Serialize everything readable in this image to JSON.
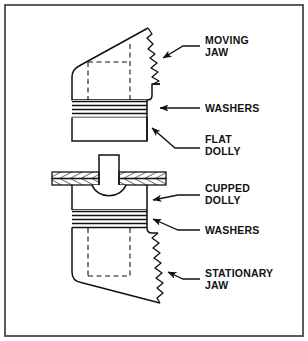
{
  "figure": {
    "background_color": "#ffffff",
    "border_color": "#4a4a4a",
    "line_color": "#111111"
  },
  "labels": {
    "moving_jaw_line1": "MOVING",
    "moving_jaw_line2": "JAW",
    "washers_top": "WASHERS",
    "flat_dolly_line1": "FLAT",
    "flat_dolly_line2": "DOLLY",
    "cupped_dolly_line1": "CUPPED",
    "cupped_dolly_line2": "DOLLY",
    "washers_bottom": "WASHERS",
    "stationary_jaw_line1": "STATIONARY",
    "stationary_jaw_line2": "JAW"
  },
  "parts": [
    {
      "id": "moving-jaw",
      "label": "MOVING JAW",
      "callout_x": 206,
      "callout_y": 44
    },
    {
      "id": "washers-top",
      "label": "WASHERS",
      "callout_x": 206,
      "callout_y": 106
    },
    {
      "id": "flat-dolly",
      "label": "FLAT DOLLY",
      "callout_x": 206,
      "callout_y": 140
    },
    {
      "id": "cupped-dolly",
      "label": "CUPPED DOLLY",
      "callout_x": 206,
      "callout_y": 193
    },
    {
      "id": "washers-bottom",
      "label": "WASHERS",
      "callout_x": 206,
      "callout_y": 228
    },
    {
      "id": "stationary-jaw",
      "label": "STATIONARY JAW",
      "callout_x": 206,
      "callout_y": 277
    }
  ]
}
